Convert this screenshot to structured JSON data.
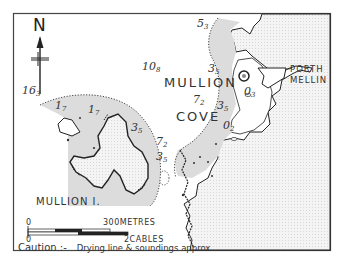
{
  "map": {
    "title": "Mullion Cove chartlet",
    "north_label": "N",
    "place_names": {
      "mullion": "MULLION",
      "cove": "COVE",
      "porth": "PORTH",
      "mellin": "MELLIN",
      "island": "MULLION I."
    },
    "soundings": [
      {
        "id": "s163",
        "main": "16",
        "sub": "3"
      },
      {
        "id": "s108",
        "main": "10",
        "sub": "8"
      },
      {
        "id": "s53",
        "main": "5",
        "sub": "3"
      },
      {
        "id": "s35a",
        "main": "3",
        "sub": "5"
      },
      {
        "id": "s72a",
        "main": "7",
        "sub": "2"
      },
      {
        "id": "s35b",
        "main": "3",
        "sub": "5"
      },
      {
        "id": "s03",
        "main": "0",
        "sub": "3"
      },
      {
        "id": "s02",
        "main": "0",
        "sub": "2"
      },
      {
        "id": "s17a",
        "main": "1",
        "sub": "7"
      },
      {
        "id": "s17b",
        "main": "1",
        "sub": "7"
      },
      {
        "id": "s35c",
        "main": "3",
        "sub": "5"
      },
      {
        "id": "s72b",
        "main": "7",
        "sub": "2"
      },
      {
        "id": "s35d",
        "main": "3",
        "sub": "5"
      }
    ],
    "scale": {
      "metres_zero": "0",
      "metres_label": "300METRES",
      "cables_zero": "0",
      "cables_label": "2CABLES"
    },
    "caution": {
      "label": "Caution :-",
      "note": "Drying line & soundings approx"
    },
    "colors": {
      "land": "#f2f2f2",
      "drying": "#dcdcdc",
      "water": "#ffffff",
      "ink": "#222222"
    }
  }
}
